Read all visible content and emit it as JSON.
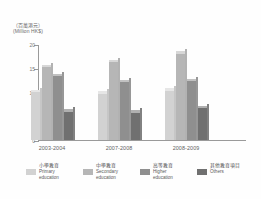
{
  "chart_data": {
    "type": "bar",
    "title": "",
    "subtitle": "",
    "xlabel": "",
    "ylabel": "",
    "unit_caption_zh": "（百萬港元）",
    "unit_caption_en": "(Million HK$)",
    "categories": [
      "2003-2004",
      "2007-2008",
      "2008-2009"
    ],
    "series": [
      {
        "name": "Primary education",
        "name_zh": "小學教育",
        "color": "#d2d2d2",
        "values": [
          10.5,
          10.2,
          10.8
        ]
      },
      {
        "name": "Secondary education",
        "name_zh": "中學教育",
        "color": "#b6b6b6",
        "values": [
          15.7,
          16.7,
          18.5
        ]
      },
      {
        "name": "Higher education",
        "name_zh": "高等教育",
        "color": "#8f8f8f",
        "values": [
          13.8,
          12.6,
          12.8
        ]
      },
      {
        "name": "Others",
        "name_zh": "其他教育項目",
        "color": "#707070",
        "values": [
          6.4,
          6.2,
          7.1
        ]
      }
    ],
    "ylim": [
      0,
      20
    ],
    "yticks": [
      0,
      5,
      10,
      15,
      20
    ],
    "ytick_labels": [
      "0",
      "5",
      "10",
      "15",
      "20"
    ],
    "grid": false,
    "legend_position": "bottom"
  },
  "axis": {
    "y_tick_labels": [
      "20",
      "15",
      "10",
      "5",
      "0"
    ]
  },
  "legend": {
    "items": [
      {
        "label_zh": "小學教育",
        "label_en_line1": "Primary",
        "label_en_line2": "education",
        "color": "#d2d2d2"
      },
      {
        "label_zh": "中學教育",
        "label_en_line1": "Secondary",
        "label_en_line2": "education",
        "color": "#b6b6b6"
      },
      {
        "label_zh": "高等教育",
        "label_en_line1": "Higher",
        "label_en_line2": "education",
        "color": "#8f8f8f"
      },
      {
        "label_zh": "其他教育項目",
        "label_en_line1": "Others",
        "label_en_line2": "",
        "color": "#707070"
      }
    ]
  },
  "colors": {
    "axis": "#9a9a9a",
    "text": "#5f5f5f",
    "background": "#fefefe"
  }
}
